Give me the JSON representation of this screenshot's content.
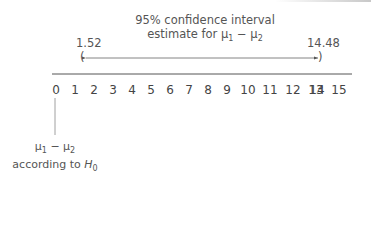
{
  "title": {
    "line1": "95% confidence interval",
    "line2_prefix": "estimate for ",
    "mu1": "μ",
    "sub1": "1",
    "minus": " − ",
    "mu2": "μ",
    "sub2": "2"
  },
  "interval": {
    "lower": "1.52",
    "upper": "14.48",
    "left_bracket": "(",
    "right_bracket": ")"
  },
  "axis": {
    "ticks": [
      "0",
      "1",
      "2",
      "3",
      "4",
      "5",
      "6",
      "7",
      "8",
      "9",
      "10",
      "11",
      "12",
      "13",
      "14",
      "15"
    ]
  },
  "null_label": {
    "line1_mu1": "μ",
    "line1_sub1": "1",
    "line1_minus": " − ",
    "line1_mu2": "μ",
    "line1_sub2": "2",
    "line2_prefix": "according to ",
    "line2_H": "H",
    "line2_sub": "0"
  },
  "colors": {
    "line": "#555555",
    "text": "#444444"
  }
}
